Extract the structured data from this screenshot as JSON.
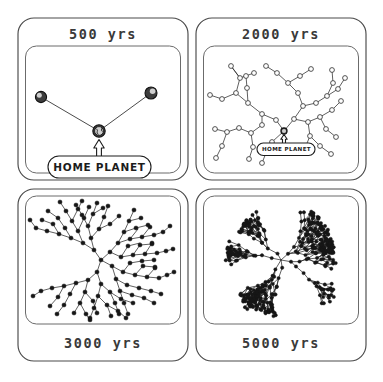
{
  "figure": {
    "background_color": "#ffffff",
    "line_color": "#2b2b2b",
    "node_fill_color": "#161616",
    "panel_border_color": "#4a4a4a",
    "layout": "2x2-grid"
  },
  "panels": [
    {
      "id": "panel-500",
      "label": "500 yrs",
      "label_position": "top",
      "node_style": "planet",
      "node_count": 3,
      "home_label": "HOME PLANET",
      "has_home_callout": true
    },
    {
      "id": "panel-2000",
      "label": "2000 yrs",
      "label_position": "top",
      "node_style": "open-circle",
      "node_count": 41,
      "home_label": "HOME PLANET",
      "has_home_callout": true
    },
    {
      "id": "panel-3000",
      "label": "3000 yrs",
      "label_position": "bottom",
      "node_style": "filled-dot",
      "node_count": 160,
      "home_label": "",
      "has_home_callout": false
    },
    {
      "id": "panel-5000",
      "label": "5000 yrs",
      "label_position": "bottom",
      "node_style": "filled-dot",
      "node_count": 420,
      "home_label": "",
      "has_home_callout": false
    }
  ],
  "chart_data": {
    "type": "scatter",
    "xlabel": "",
    "ylabel": "",
    "series": [
      {
        "name": "500 yrs",
        "colonized_nodes": 3,
        "radius_fraction": 0.18
      },
      {
        "name": "2000 yrs",
        "colonized_nodes": 41,
        "radius_fraction": 0.52
      },
      {
        "name": "3000 yrs",
        "colonized_nodes": 160,
        "radius_fraction": 0.8
      },
      {
        "name": "5000 yrs",
        "colonized_nodes": 420,
        "radius_fraction": 0.98
      }
    ],
    "categories": [
      "500 yrs",
      "2000 yrs",
      "3000 yrs",
      "5000 yrs"
    ],
    "values": [
      3,
      41,
      160,
      420
    ],
    "annotations": [
      "HOME PLANET"
    ],
    "grid": false,
    "legend": "none"
  }
}
